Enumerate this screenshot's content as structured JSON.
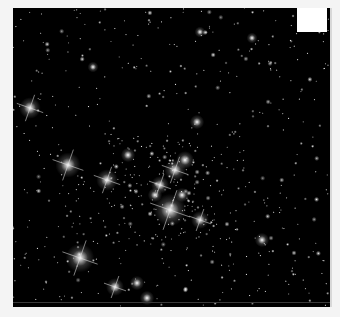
{
  "image": {
    "subject": "star cluster field",
    "background_color": "#000000",
    "page_color": "#f4f4f4",
    "frame": {
      "x": 13,
      "y": 8,
      "w": 317,
      "h": 299
    },
    "corner_box": {
      "x": 297,
      "y": 8,
      "w": 30,
      "h": 24,
      "color": "#ffffff"
    }
  },
  "bright_stars": [
    {
      "x": 30,
      "y": 108,
      "r": 6,
      "spikes": true
    },
    {
      "x": 68,
      "y": 165,
      "r": 7,
      "spikes": true
    },
    {
      "x": 107,
      "y": 180,
      "r": 6,
      "spikes": true
    },
    {
      "x": 80,
      "y": 258,
      "r": 8,
      "spikes": true
    },
    {
      "x": 115,
      "y": 287,
      "r": 5,
      "spikes": true
    },
    {
      "x": 137,
      "y": 283,
      "r": 4,
      "spikes": false
    },
    {
      "x": 147,
      "y": 298,
      "r": 4,
      "spikes": false
    },
    {
      "x": 170,
      "y": 210,
      "r": 9,
      "spikes": true
    },
    {
      "x": 175,
      "y": 170,
      "r": 6,
      "spikes": true
    },
    {
      "x": 160,
      "y": 185,
      "r": 5,
      "spikes": true
    },
    {
      "x": 185,
      "y": 160,
      "r": 5,
      "spikes": false
    },
    {
      "x": 155,
      "y": 195,
      "r": 4,
      "spikes": false
    },
    {
      "x": 182,
      "y": 195,
      "r": 4,
      "spikes": false
    },
    {
      "x": 200,
      "y": 220,
      "r": 5,
      "spikes": true
    },
    {
      "x": 128,
      "y": 155,
      "r": 4,
      "spikes": false
    },
    {
      "x": 197,
      "y": 122,
      "r": 4,
      "spikes": false
    },
    {
      "x": 262,
      "y": 240,
      "r": 4,
      "spikes": false
    },
    {
      "x": 93,
      "y": 67,
      "r": 3,
      "spikes": false
    },
    {
      "x": 200,
      "y": 32,
      "r": 3,
      "spikes": false
    },
    {
      "x": 252,
      "y": 38,
      "r": 3,
      "spikes": false
    }
  ],
  "field_star_count": 650,
  "field_seed": 7
}
